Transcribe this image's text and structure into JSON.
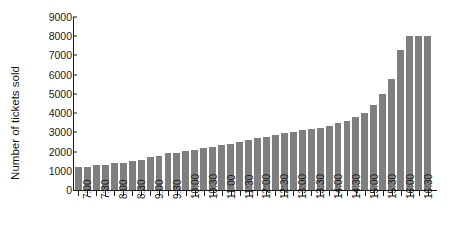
{
  "chart_data": {
    "type": "bar",
    "title": "",
    "xlabel": "",
    "ylabel": "Number of tickets sold",
    "ylim": [
      0,
      9000
    ],
    "ytick_labels": [
      "0",
      "1000",
      "2000",
      "3000",
      "4000",
      "5000",
      "6000",
      "7000",
      "8000",
      "9000"
    ],
    "ytick_values": [
      0,
      1000,
      2000,
      3000,
      4000,
      5000,
      6000,
      7000,
      8000,
      9000
    ],
    "grid": false,
    "legend": false,
    "bar_color": "#7f7f7f",
    "axis_color": "#1a1a1a",
    "background": "#ffffff",
    "xtick_labels": [
      "7:00",
      "7:30",
      "8:00",
      "8:30",
      "9:00",
      "9:30",
      "10:00",
      "10:30",
      "11:00",
      "11:30",
      "12:00",
      "12:30",
      "13:00",
      "13:30",
      "14:00",
      "14:30",
      "15:00",
      "15:30",
      "16:00",
      "16:30"
    ],
    "categories": [
      "7:00",
      "7:15",
      "7:30",
      "7:45",
      "8:00",
      "8:15",
      "8:30",
      "8:45",
      "9:00",
      "9:15",
      "9:30",
      "9:45",
      "10:00",
      "10:15",
      "10:30",
      "10:45",
      "11:00",
      "11:15",
      "11:30",
      "11:45",
      "12:00",
      "12:15",
      "12:30",
      "12:45",
      "13:00",
      "13:15",
      "13:30",
      "13:45",
      "14:00",
      "14:15",
      "14:30",
      "14:45",
      "15:00",
      "15:15",
      "15:30",
      "15:45",
      "16:00",
      "16:15",
      "16:30",
      "16:45"
    ],
    "values": [
      1200,
      1200,
      1300,
      1300,
      1400,
      1400,
      1500,
      1550,
      1700,
      1750,
      1900,
      1950,
      2050,
      2100,
      2200,
      2250,
      2350,
      2400,
      2500,
      2600,
      2700,
      2750,
      2850,
      2950,
      3000,
      3100,
      3200,
      3250,
      3350,
      3500,
      3600,
      3800,
      4000,
      4400,
      5000,
      5800,
      7300,
      8000,
      8000,
      8000
    ]
  }
}
